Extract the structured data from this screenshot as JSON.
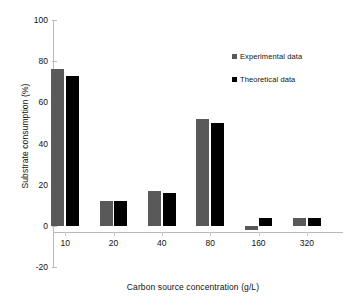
{
  "chart_data": {
    "type": "bar",
    "title": "",
    "xlabel": "Carbon source concentration (g/L)",
    "ylabel": "Substrate consumption (%)",
    "categories": [
      "10",
      "20",
      "40",
      "80",
      "160",
      "320"
    ],
    "series": [
      {
        "name": "Experimental data",
        "color": "#595959",
        "values": [
          76,
          12,
          17,
          52,
          -2,
          4
        ]
      },
      {
        "name": "Theoretical data",
        "color": "#000000",
        "values": [
          73,
          12,
          16,
          50,
          4,
          4
        ]
      }
    ],
    "ylim": [
      -20,
      100
    ],
    "yticks": [
      "-20",
      "0",
      "20",
      "40",
      "60",
      "80",
      "100"
    ],
    "grid": false,
    "legend_position": "top-right"
  },
  "legend": {
    "items": [
      {
        "label": "Experimental data"
      },
      {
        "label": "Theoretical data"
      }
    ]
  }
}
